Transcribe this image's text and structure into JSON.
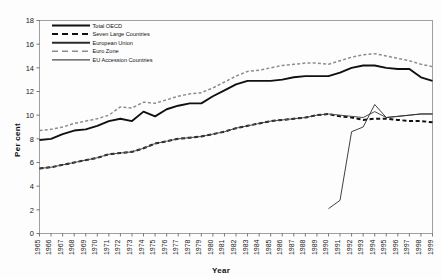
{
  "chart_data": {
    "type": "line",
    "title": "",
    "subtitle": "",
    "xlabel": "Year",
    "ylabel": "Per cent",
    "grid": false,
    "legend_position": "top-left",
    "xlim": [
      1965,
      1999
    ],
    "ylim": [
      0,
      18
    ],
    "ytick_step": 2,
    "yticks": [
      0,
      2,
      4,
      6,
      8,
      10,
      12,
      14,
      16,
      18
    ],
    "x": [
      1965,
      1966,
      1967,
      1968,
      1969,
      1970,
      1971,
      1972,
      1973,
      1974,
      1975,
      1976,
      1977,
      1978,
      1979,
      1980,
      1981,
      1982,
      1983,
      1984,
      1985,
      1986,
      1987,
      1988,
      1989,
      1990,
      1991,
      1992,
      1993,
      1994,
      1995,
      1996,
      1997,
      1998,
      1999
    ],
    "categories": [
      "1965",
      "1966",
      "1967",
      "1968",
      "1969",
      "1970",
      "1971",
      "1972",
      "1973",
      "1974",
      "1975",
      "1976",
      "1977",
      "1978",
      "1979",
      "1980",
      "1981",
      "1982",
      "1983",
      "1984",
      "1985",
      "1986",
      "1987",
      "1988",
      "1989",
      "1990",
      "1991",
      "1992",
      "1993",
      "1994",
      "1995",
      "1996",
      "1997",
      "1998",
      "1999"
    ],
    "series": [
      {
        "name": "Total OECD",
        "style": "solid",
        "width": 1.9,
        "color": "#101010",
        "values": [
          7.9,
          8.0,
          8.4,
          8.7,
          8.8,
          9.1,
          9.5,
          9.7,
          9.5,
          10.3,
          9.9,
          10.5,
          10.8,
          11.0,
          11.0,
          11.6,
          12.1,
          12.6,
          12.9,
          12.9,
          12.9,
          13.0,
          13.2,
          13.3,
          13.3,
          13.3,
          13.6,
          14.0,
          14.2,
          14.2,
          14.0,
          13.9,
          13.9,
          13.2,
          12.9
        ]
      },
      {
        "name": "Seven Large Countries",
        "style": "dashed",
        "width": 2.0,
        "color": "#101010",
        "values": [
          5.5,
          5.6,
          5.8,
          6.0,
          6.2,
          6.4,
          6.7,
          6.8,
          6.9,
          7.2,
          7.6,
          7.8,
          8.0,
          8.1,
          8.2,
          8.4,
          8.6,
          8.9,
          9.1,
          9.3,
          9.5,
          9.6,
          9.7,
          9.8,
          10.0,
          10.1,
          9.9,
          9.8,
          9.6,
          9.7,
          9.7,
          9.6,
          9.5,
          9.5,
          9.4
        ]
      },
      {
        "name": "European Union",
        "style": "solid",
        "width": 1.0,
        "color": "#4a4a4a",
        "values": [
          5.5,
          5.6,
          5.8,
          6.0,
          6.2,
          6.4,
          6.7,
          6.8,
          6.9,
          7.2,
          7.6,
          7.8,
          8.0,
          8.1,
          8.2,
          8.4,
          8.6,
          8.9,
          9.1,
          9.3,
          9.5,
          9.6,
          9.7,
          9.8,
          10.0,
          10.1,
          10.0,
          9.9,
          9.8,
          10.3,
          9.8,
          9.9,
          10.0,
          10.1,
          10.1
        ]
      },
      {
        "name": "Euro Zone",
        "style": "dashed",
        "width": 1.5,
        "color": "#8c8c8c",
        "values": [
          8.7,
          8.8,
          9.0,
          9.3,
          9.5,
          9.7,
          10.0,
          10.7,
          10.6,
          11.1,
          11.0,
          11.3,
          11.6,
          11.8,
          11.9,
          12.3,
          12.8,
          13.3,
          13.7,
          13.8,
          14.0,
          14.2,
          14.3,
          14.4,
          14.4,
          14.3,
          14.6,
          14.9,
          15.1,
          15.2,
          15.0,
          14.8,
          14.6,
          14.3,
          14.1
        ]
      },
      {
        "name": "EU Accession Countries",
        "style": "solid",
        "width": 0.9,
        "color": "#2b2b2b",
        "start_year": 1990,
        "values": [
          null,
          null,
          null,
          null,
          null,
          null,
          null,
          null,
          null,
          null,
          null,
          null,
          null,
          null,
          null,
          null,
          null,
          null,
          null,
          null,
          null,
          null,
          null,
          null,
          null,
          2.1,
          2.8,
          8.6,
          9.0,
          10.9,
          9.8,
          9.9,
          10.0,
          10.1,
          10.1
        ]
      }
    ],
    "annotations": []
  },
  "legend": {
    "items": [
      {
        "label": "Total OECD",
        "style": "solid",
        "color": "#101010",
        "width": 1.9
      },
      {
        "label": "Seven Large Countries",
        "style": "dashed",
        "color": "#101010",
        "width": 2.0
      },
      {
        "label": "European Union",
        "style": "solid",
        "color": "#2b2b2b",
        "width": 2.0
      },
      {
        "label": "Euro Zone",
        "style": "dashed",
        "color": "#8c8c8c",
        "width": 1.5
      },
      {
        "label": "EU Accession Countries",
        "style": "solid",
        "color": "#4a4a4a",
        "width": 1.2
      }
    ]
  },
  "axes": {
    "y_axis_label": "Per cent",
    "x_axis_label": "Year"
  }
}
